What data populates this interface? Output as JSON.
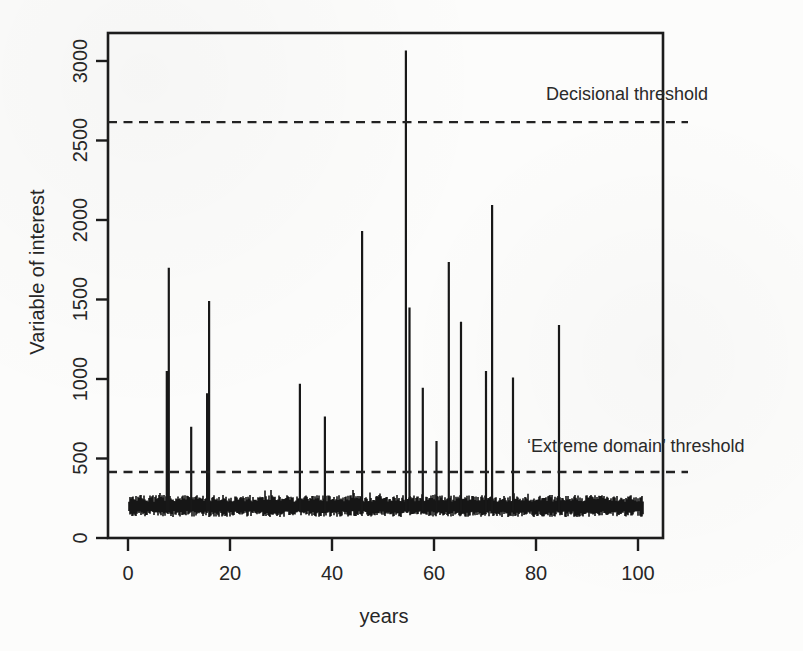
{
  "figure": {
    "background": "#fcfcfb",
    "ink": "#1c1c1c",
    "text_color": "#262626"
  },
  "chart_data": {
    "type": "line",
    "subtype": "spike-time-series",
    "title": "",
    "xlabel": "years",
    "ylabel": "Variable of interest",
    "x_ticks": [
      0,
      20,
      40,
      60,
      80,
      100
    ],
    "y_ticks": [
      0,
      500,
      1000,
      1500,
      2000,
      2500,
      3000
    ],
    "xlim": [
      -4,
      105
    ],
    "ylim": [
      0,
      3176
    ],
    "grid": false,
    "legend": false,
    "thresholds": [
      {
        "label": "Decisional threshold",
        "value": 2615,
        "line_style": "dashed"
      },
      {
        "label": "‘Extreme domain’ threshold",
        "value": 415,
        "line_style": "dashed"
      }
    ],
    "spikes": [
      {
        "x": 7.6,
        "y": 1050
      },
      {
        "x": 8.0,
        "y": 1700
      },
      {
        "x": 12.4,
        "y": 700
      },
      {
        "x": 15.5,
        "y": 910
      },
      {
        "x": 15.9,
        "y": 1490
      },
      {
        "x": 33.7,
        "y": 970
      },
      {
        "x": 38.6,
        "y": 765
      },
      {
        "x": 45.9,
        "y": 1930
      },
      {
        "x": 54.5,
        "y": 3065
      },
      {
        "x": 55.2,
        "y": 1450
      },
      {
        "x": 57.8,
        "y": 945
      },
      {
        "x": 60.5,
        "y": 610
      },
      {
        "x": 62.9,
        "y": 1735
      },
      {
        "x": 65.3,
        "y": 1360
      },
      {
        "x": 70.2,
        "y": 1050
      },
      {
        "x": 71.4,
        "y": 2095
      },
      {
        "x": 75.5,
        "y": 1010
      },
      {
        "x": 84.5,
        "y": 1340
      }
    ],
    "noise_band": {
      "x_start": 0.2,
      "x_end": 101,
      "base_mean": 200,
      "min": 130,
      "max": 275,
      "description": "dense black baseline noise band of ordinary observations"
    }
  }
}
